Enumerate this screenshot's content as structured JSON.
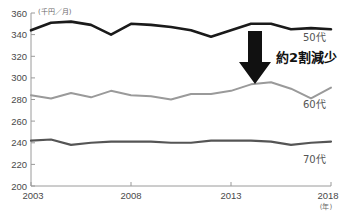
{
  "chart_data": {
    "type": "line",
    "title": "",
    "subtitle": "",
    "xlabel": "(年)",
    "ylabel": "(千円／月)",
    "yunit": "(千円／月)",
    "xunit": "(年)",
    "xlim": [
      2003,
      2018
    ],
    "ylim": [
      200,
      360
    ],
    "yticks": [
      200,
      220,
      240,
      260,
      280,
      300,
      320,
      340,
      360
    ],
    "ytick_labels": [
      "200",
      "220",
      "240",
      "260",
      "280",
      "300",
      "320",
      "340",
      "360"
    ],
    "xticks": [
      2003,
      2008,
      2013,
      2018
    ],
    "xtick_labels": [
      "2003",
      "2008",
      "2013",
      "2018"
    ],
    "grid": false,
    "legend_position": "right-inline",
    "x": [
      2003,
      2004,
      2005,
      2006,
      2007,
      2008,
      2009,
      2010,
      2011,
      2012,
      2013,
      2014,
      2015,
      2016,
      2017,
      2018
    ],
    "series": [
      {
        "name": "50代",
        "label": "50代",
        "color": "#1a1a1a",
        "width": 2.6,
        "values": [
          344,
          351,
          352,
          349,
          340,
          350,
          349,
          347,
          344,
          338,
          344,
          350,
          350,
          345,
          346,
          345
        ]
      },
      {
        "name": "60代",
        "label": "60代",
        "color": "#9a9a9a",
        "width": 2.0,
        "values": [
          284,
          281,
          286,
          282,
          288,
          284,
          283,
          280,
          285,
          285,
          288,
          294,
          296,
          290,
          281,
          291
        ]
      },
      {
        "name": "70代",
        "label": "70代",
        "color": "#555555",
        "width": 2.2,
        "values": [
          242,
          243,
          238,
          240,
          241,
          241,
          241,
          240,
          240,
          242,
          242,
          242,
          241,
          238,
          240,
          241
        ]
      }
    ],
    "annotations": [
      {
        "id": "decrease-callout",
        "text": "約2割減少",
        "icon": "down-arrow",
        "x_px": 262,
        "y_px": 58
      }
    ]
  },
  "colors": {
    "background": "#ffffff",
    "axis": "#9a9a9a",
    "tick_text": "#4a4a4a",
    "series_50": "#1a1a1a",
    "series_60": "#9a9a9a",
    "series_70": "#555555",
    "annotation": "#111111"
  }
}
